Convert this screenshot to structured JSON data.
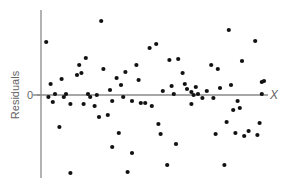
{
  "chart_data": {
    "type": "scatter",
    "title": "",
    "xlabel": "X",
    "ylabel": "Residuals",
    "y_tick_labels": [
      "0"
    ],
    "x_tick_labels": [],
    "grid": false,
    "legend": null,
    "xlim": [
      0,
      100
    ],
    "ylim": [
      -85,
      85
    ],
    "zero_line": true,
    "colors": {
      "points": "#111111",
      "axis": "#8a8a8a",
      "labels": "#666666"
    },
    "points": [
      [
        1,
        53
      ],
      [
        2,
        -2
      ],
      [
        3,
        11
      ],
      [
        4,
        -7
      ],
      [
        5,
        1
      ],
      [
        8,
        16
      ],
      [
        7,
        -32
      ],
      [
        9,
        -2
      ],
      [
        10,
        1
      ],
      [
        12,
        -9
      ],
      [
        12,
        -78
      ],
      [
        16,
        30
      ],
      [
        15,
        20
      ],
      [
        17,
        22
      ],
      [
        19,
        37
      ],
      [
        18,
        -9
      ],
      [
        20,
        1
      ],
      [
        21,
        -2
      ],
      [
        23,
        -11
      ],
      [
        24,
        0
      ],
      [
        25,
        -22
      ],
      [
        27,
        26
      ],
      [
        26,
        74
      ],
      [
        29,
        -20
      ],
      [
        30,
        5
      ],
      [
        31,
        -6
      ],
      [
        31,
        -52
      ],
      [
        33,
        17
      ],
      [
        34,
        -38
      ],
      [
        35,
        10
      ],
      [
        36,
        -2
      ],
      [
        37,
        23
      ],
      [
        38,
        -77
      ],
      [
        40,
        -6
      ],
      [
        40,
        -58
      ],
      [
        42,
        30
      ],
      [
        43,
        15
      ],
      [
        44,
        -8
      ],
      [
        46,
        -8
      ],
      [
        48,
        47
      ],
      [
        49,
        -11
      ],
      [
        51,
        51
      ],
      [
        52,
        -29
      ],
      [
        53,
        -39
      ],
      [
        54,
        4
      ],
      [
        56,
        -70
      ],
      [
        57,
        35
      ],
      [
        58,
        9
      ],
      [
        59,
        1
      ],
      [
        60,
        -49
      ],
      [
        61,
        36
      ],
      [
        63,
        22
      ],
      [
        64,
        11
      ],
      [
        65,
        6
      ],
      [
        67,
        -9
      ],
      [
        67,
        3
      ],
      [
        68,
        0
      ],
      [
        69,
        8
      ],
      [
        70,
        1
      ],
      [
        72,
        -3
      ],
      [
        74,
        4
      ],
      [
        76,
        30
      ],
      [
        77,
        -3
      ],
      [
        78,
        -39
      ],
      [
        79,
        26
      ],
      [
        80,
        7
      ],
      [
        82,
        -70
      ],
      [
        83,
        -27
      ],
      [
        84,
        65
      ],
      [
        85,
        10
      ],
      [
        86,
        -15
      ],
      [
        87,
        -38
      ],
      [
        88,
        -6
      ],
      [
        89,
        -13
      ],
      [
        90,
        34
      ],
      [
        91,
        -41
      ],
      [
        93,
        -36
      ],
      [
        96,
        54
      ],
      [
        97,
        -40
      ],
      [
        98,
        -28
      ],
      [
        99,
        1
      ],
      [
        99,
        13
      ],
      [
        100,
        14
      ]
    ]
  }
}
